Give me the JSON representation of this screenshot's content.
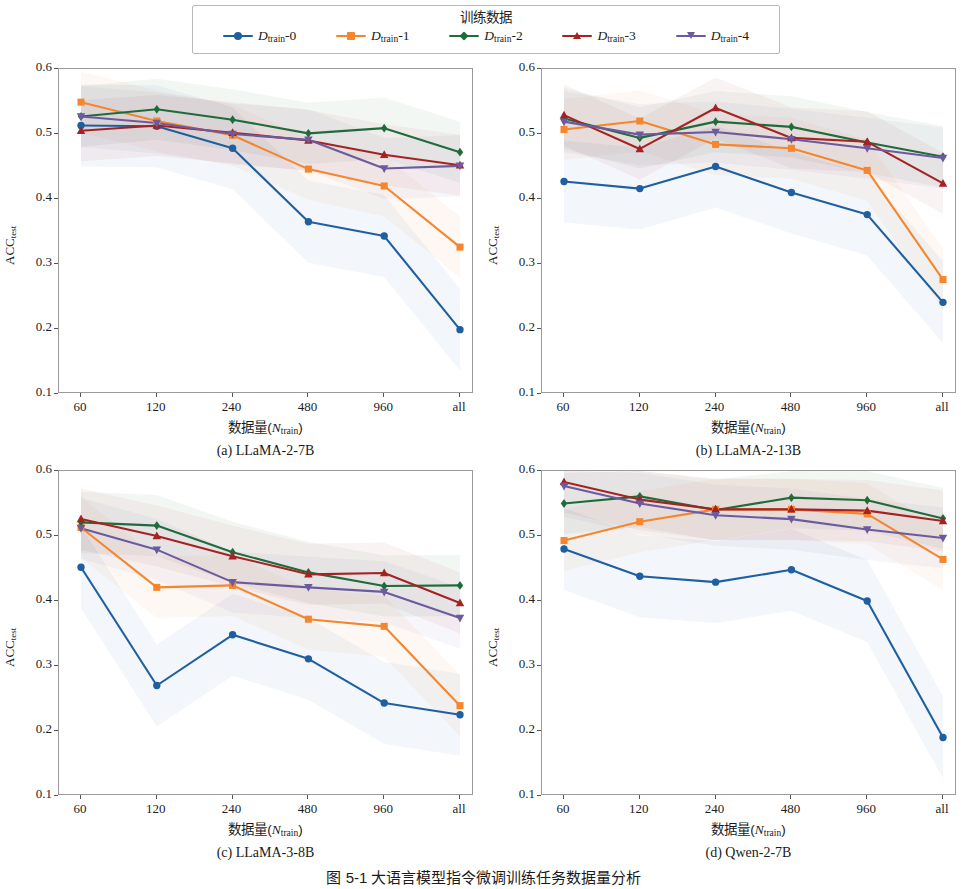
{
  "legend": {
    "title": "训练数据",
    "items": [
      {
        "label_base": "D",
        "label_sub": "train",
        "label_idx": "-0",
        "color": "#1f5fa0",
        "marker": "circle"
      },
      {
        "label_base": "D",
        "label_sub": "train",
        "label_idx": "-1",
        "color": "#f5862e",
        "marker": "square"
      },
      {
        "label_base": "D",
        "label_sub": "train",
        "label_idx": "-2",
        "color": "#1f6b3b",
        "marker": "diamond"
      },
      {
        "label_base": "D",
        "label_sub": "train",
        "label_idx": "-3",
        "color": "#a52223",
        "marker": "triangle-up"
      },
      {
        "label_base": "D",
        "label_sub": "train",
        "label_idx": "-4",
        "color": "#6b5b9e",
        "marker": "triangle-down"
      }
    ]
  },
  "figure_caption": "图 5-1  大语言模型指令微调训练任务数据量分析",
  "axis": {
    "ylabel_base": "ACC",
    "ylabel_sub": "test",
    "xlabel_prefix": "数据量(",
    "xlabel_var": "N",
    "xlabel_sub": "train",
    "xlabel_suffix": ")",
    "yticks": [
      "0.6",
      "0.5",
      "0.4",
      "0.3",
      "0.2",
      "0.1"
    ],
    "xticks": [
      "60",
      "120",
      "240",
      "480",
      "960",
      "all"
    ]
  },
  "chart_data": [
    {
      "type": "line",
      "panel": "a",
      "title": "(a) LLaMA-2-7B",
      "xlabel": "数据量(N_train)",
      "ylabel": "ACC_test",
      "categories": [
        "60",
        "120",
        "240",
        "480",
        "960",
        "all"
      ],
      "ylim": [
        0.1,
        0.6
      ],
      "grid": false,
      "legend_position": "top-outside",
      "series": [
        {
          "name": "D_train-0",
          "color": "#1f5fa0",
          "marker": "circle",
          "values": [
            0.513,
            0.512,
            0.478,
            0.365,
            0.343,
            0.199
          ]
        },
        {
          "name": "D_train-1",
          "color": "#f5862e",
          "marker": "square",
          "values": [
            0.549,
            0.52,
            0.498,
            0.446,
            0.42,
            0.326
          ]
        },
        {
          "name": "D_train-2",
          "color": "#1f6b3b",
          "marker": "diamond",
          "values": [
            0.527,
            0.538,
            0.522,
            0.501,
            0.509,
            0.472
          ]
        },
        {
          "name": "D_train-3",
          "color": "#a52223",
          "marker": "triangle-up",
          "values": [
            0.505,
            0.513,
            0.502,
            0.49,
            0.468,
            0.452
          ]
        },
        {
          "name": "D_train-4",
          "color": "#6b5b9e",
          "marker": "triangle-down",
          "values": [
            0.527,
            0.517,
            0.5,
            0.491,
            0.447,
            0.451
          ]
        }
      ]
    },
    {
      "type": "line",
      "panel": "b",
      "title": "(b) LLaMA-2-13B",
      "xlabel": "数据量(N_train)",
      "ylabel": "ACC_test",
      "categories": [
        "60",
        "120",
        "240",
        "480",
        "960",
        "all"
      ],
      "ylim": [
        0.1,
        0.6
      ],
      "grid": false,
      "legend_position": "top-outside",
      "series": [
        {
          "name": "D_train-0",
          "color": "#1f5fa0",
          "marker": "circle",
          "values": [
            0.427,
            0.416,
            0.45,
            0.41,
            0.376,
            0.241
          ]
        },
        {
          "name": "D_train-1",
          "color": "#f5862e",
          "marker": "square",
          "values": [
            0.507,
            0.52,
            0.484,
            0.478,
            0.444,
            0.276
          ]
        },
        {
          "name": "D_train-2",
          "color": "#1f6b3b",
          "marker": "diamond",
          "values": [
            0.524,
            0.494,
            0.519,
            0.511,
            0.487,
            0.465
          ]
        },
        {
          "name": "D_train-3",
          "color": "#a52223",
          "marker": "triangle-up",
          "values": [
            0.529,
            0.477,
            0.54,
            0.494,
            0.488,
            0.424
          ]
        },
        {
          "name": "D_train-4",
          "color": "#6b5b9e",
          "marker": "triangle-down",
          "values": [
            0.519,
            0.499,
            0.503,
            0.492,
            0.478,
            0.463
          ]
        }
      ]
    },
    {
      "type": "line",
      "panel": "c",
      "title": "(c) LLaMA-3-8B",
      "xlabel": "数据量(N_train)",
      "ylabel": "ACC_test",
      "categories": [
        "60",
        "120",
        "240",
        "480",
        "960",
        "all"
      ],
      "ylim": [
        0.1,
        0.6
      ],
      "grid": false,
      "legend_position": "top-outside",
      "series": [
        {
          "name": "D_train-0",
          "color": "#1f5fa0",
          "marker": "circle",
          "values": [
            0.452,
            0.27,
            0.348,
            0.311,
            0.243,
            0.225
          ]
        },
        {
          "name": "D_train-1",
          "color": "#f5862e",
          "marker": "square",
          "values": [
            0.513,
            0.421,
            0.424,
            0.372,
            0.361,
            0.239
          ]
        },
        {
          "name": "D_train-2",
          "color": "#1f6b3b",
          "marker": "diamond",
          "values": [
            0.521,
            0.516,
            0.475,
            0.444,
            0.423,
            0.424
          ]
        },
        {
          "name": "D_train-3",
          "color": "#a52223",
          "marker": "triangle-up",
          "values": [
            0.526,
            0.5,
            0.469,
            0.441,
            0.443,
            0.397
          ]
        },
        {
          "name": "D_train-4",
          "color": "#6b5b9e",
          "marker": "triangle-down",
          "values": [
            0.512,
            0.479,
            0.429,
            0.421,
            0.414,
            0.374
          ]
        }
      ]
    },
    {
      "type": "line",
      "panel": "d",
      "title": "(d) Qwen-2-7B",
      "xlabel": "数据量(N_train)",
      "ylabel": "ACC_test",
      "categories": [
        "60",
        "120",
        "240",
        "480",
        "960",
        "all"
      ],
      "ylim": [
        0.1,
        0.6
      ],
      "grid": false,
      "legend_position": "top-outside",
      "series": [
        {
          "name": "D_train-0",
          "color": "#1f5fa0",
          "marker": "circle",
          "values": [
            0.48,
            0.438,
            0.429,
            0.448,
            0.4,
            0.19
          ]
        },
        {
          "name": "D_train-1",
          "color": "#f5862e",
          "marker": "square",
          "values": [
            0.493,
            0.522,
            0.541,
            0.541,
            0.534,
            0.464
          ]
        },
        {
          "name": "D_train-2",
          "color": "#1f6b3b",
          "marker": "diamond",
          "values": [
            0.55,
            0.561,
            0.54,
            0.559,
            0.555,
            0.527
          ]
        },
        {
          "name": "D_train-3",
          "color": "#a52223",
          "marker": "triangle-up",
          "values": [
            0.583,
            0.556,
            0.541,
            0.541,
            0.539,
            0.523
          ]
        },
        {
          "name": "D_train-4",
          "color": "#6b5b9e",
          "marker": "triangle-down",
          "values": [
            0.577,
            0.55,
            0.532,
            0.526,
            0.51,
            0.497
          ]
        }
      ]
    }
  ]
}
